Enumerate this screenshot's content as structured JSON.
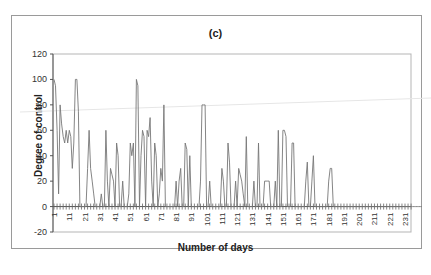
{
  "chart_data": {
    "type": "line",
    "title": "(c)",
    "xlabel": "Number of days",
    "ylabel": "Degree of control",
    "ylim": [
      -20,
      120
    ],
    "xlim": [
      1,
      236
    ],
    "yticks": [
      -20,
      0,
      20,
      40,
      60,
      80,
      100,
      120
    ],
    "xticks": [
      1,
      11,
      21,
      31,
      41,
      51,
      61,
      71,
      81,
      91,
      101,
      111,
      121,
      131,
      141,
      151,
      161,
      171,
      181,
      191,
      201,
      211,
      221,
      231
    ],
    "grid": false,
    "legend": null,
    "series": [
      {
        "name": "Degree of control",
        "color": "#777777",
        "x_start": 1,
        "values": [
          100,
          95,
          60,
          10,
          80,
          65,
          55,
          50,
          60,
          50,
          60,
          55,
          30,
          50,
          100,
          100,
          75,
          0,
          0,
          0,
          0,
          0,
          30,
          60,
          30,
          20,
          10,
          0,
          0,
          0,
          0,
          10,
          0,
          0,
          60,
          20,
          0,
          30,
          25,
          20,
          0,
          50,
          40,
          0,
          0,
          20,
          0,
          0,
          0,
          10,
          50,
          40,
          50,
          0,
          100,
          95,
          0,
          40,
          60,
          55,
          0,
          60,
          55,
          70,
          20,
          0,
          50,
          40,
          0,
          10,
          30,
          20,
          80,
          0,
          0,
          0,
          0,
          0,
          0,
          0,
          20,
          0,
          20,
          30,
          0,
          0,
          50,
          45,
          0,
          40,
          0,
          0,
          0,
          0,
          0,
          0,
          20,
          80,
          80,
          80,
          0,
          0,
          20,
          0,
          0,
          0,
          0,
          0,
          0,
          0,
          30,
          20,
          0,
          0,
          50,
          35,
          0,
          0,
          0,
          20,
          0,
          30,
          25,
          20,
          10,
          0,
          55,
          0,
          0,
          0,
          0,
          20,
          0,
          0,
          50,
          0,
          0,
          0,
          20,
          20,
          20,
          20,
          0,
          0,
          0,
          20,
          0,
          60,
          0,
          0,
          60,
          60,
          55,
          0,
          0,
          0,
          50,
          50,
          0,
          0,
          0,
          0,
          0,
          0,
          0,
          20,
          35,
          0,
          0,
          20,
          40,
          0,
          0,
          0,
          0,
          0,
          0,
          0,
          0,
          0,
          20,
          30,
          30,
          0,
          0,
          0,
          0,
          0,
          0,
          0,
          0,
          0,
          0,
          0,
          0,
          0,
          0,
          0,
          0,
          0,
          0,
          0,
          0,
          0,
          0,
          0,
          0,
          0,
          0,
          0,
          0,
          0,
          0,
          0,
          0,
          0,
          0,
          0,
          0,
          0,
          0,
          0,
          0,
          0,
          0,
          0,
          0,
          0,
          0,
          0,
          0,
          0,
          0,
          0,
          0,
          0,
          0,
          0,
          0,
          0,
          0,
          0
        ]
      }
    ]
  },
  "labels": {
    "title": "(c)",
    "xlabel": "Number of days",
    "ylabel": "Degree of control"
  }
}
